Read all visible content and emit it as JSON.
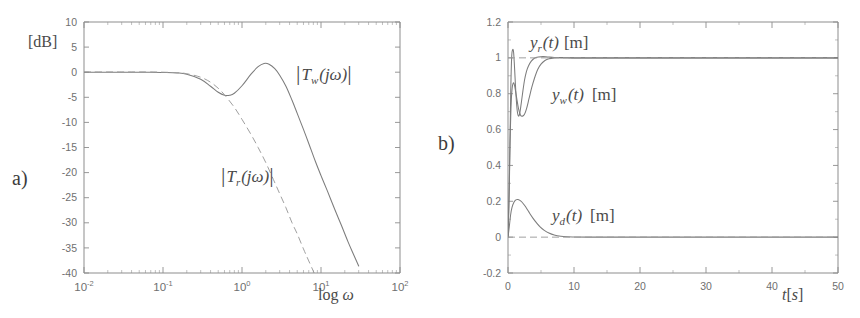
{
  "figure": {
    "background": "#ffffff",
    "line_color": "#7c7c7c",
    "axis_color": "#8d8d8d",
    "text_color": "#4a4a4a"
  },
  "panels": [
    {
      "letter": "a)",
      "name": "bode-magnitude-plot"
    },
    {
      "letter": "b)",
      "name": "time-response-plot"
    }
  ],
  "chart_data": [
    {
      "type": "line",
      "panel": "a",
      "title": "",
      "xlabel": "log ω",
      "ylabel": "[dB]",
      "xscale": "log",
      "xlim": [
        0.01,
        100
      ],
      "ylim": [
        -40,
        10
      ],
      "grid": false,
      "xticks": [
        0.01,
        0.1,
        1,
        10,
        100
      ],
      "xticklabels": [
        "10⁻²",
        "10⁻¹",
        "10⁰",
        "10¹",
        "10²"
      ],
      "xtick_mantissa": [
        "10",
        "10",
        "10",
        "10",
        "10"
      ],
      "xtick_exponent": [
        "-2",
        "-1",
        "0",
        "1",
        "2"
      ],
      "yticks": [
        10,
        5,
        0,
        -5,
        -10,
        -15,
        -20,
        -25,
        -30,
        -35,
        -40
      ],
      "yticklabels": [
        "10",
        "5",
        "0",
        "-5",
        "-10",
        "-15",
        "-20",
        "-25",
        "-30",
        "-35",
        "-40"
      ],
      "legend_position": "inline-annotations",
      "series": [
        {
          "name": "|T_w(jω)|",
          "label_text": "|T_w(jω)|",
          "label_main": "T",
          "label_sub": "w",
          "label_tail": "(jω)",
          "style": "solid",
          "x": [
            0.01,
            0.02,
            0.04,
            0.07,
            0.1,
            0.15,
            0.2,
            0.3,
            0.4,
            0.5,
            0.6,
            0.7,
            0.8,
            1.0,
            1.3,
            1.6,
            1.9,
            2.2,
            2.6,
            3.0,
            3.6,
            4.3,
            5.0,
            6.0,
            7.0,
            8.5,
            10.0,
            12.0,
            15.0,
            18.0,
            22.0,
            26.0,
            30.0
          ],
          "y": [
            0.0,
            0.0,
            0.0,
            0.0,
            -0.05,
            -0.15,
            -0.4,
            -1.4,
            -2.8,
            -4.0,
            -4.6,
            -4.6,
            -4.2,
            -2.7,
            -0.4,
            1.1,
            1.75,
            1.6,
            0.7,
            -0.6,
            -2.8,
            -5.6,
            -8.2,
            -11.4,
            -14.2,
            -17.8,
            -20.6,
            -23.6,
            -27.4,
            -30.4,
            -33.8,
            -36.4,
            -38.6
          ]
        },
        {
          "name": "|T_r(jω)|",
          "label_text": "|T_r(jω)|",
          "label_main": "T",
          "label_sub": "r",
          "label_tail": "(jω)",
          "style": "dashed",
          "x": [
            0.01,
            0.03,
            0.06,
            0.1,
            0.15,
            0.2,
            0.3,
            0.4,
            0.5,
            0.6,
            0.8,
            1.0,
            1.3,
            1.6,
            2.0,
            2.5,
            3.0,
            3.6,
            4.3,
            5.0,
            6.0,
            7.0,
            8.5,
            10.0,
            12.0
          ],
          "y": [
            0.05,
            0.05,
            0.05,
            0.0,
            -0.1,
            -0.3,
            -1.0,
            -2.0,
            -3.2,
            -4.5,
            -7.0,
            -9.4,
            -12.4,
            -15.0,
            -18.0,
            -21.4,
            -24.2,
            -27.0,
            -30.0,
            -32.2,
            -35.2,
            -37.6,
            -40.5,
            -42.5,
            -45.0
          ]
        }
      ]
    },
    {
      "type": "line",
      "panel": "b",
      "title": "",
      "xlabel": "t[s]",
      "ylabel": "",
      "xscale": "linear",
      "xlim": [
        0,
        50
      ],
      "ylim": [
        -0.2,
        1.2
      ],
      "grid": false,
      "xticks": [
        0,
        10,
        20,
        30,
        40,
        50
      ],
      "xticklabels": [
        "0",
        "10",
        "20",
        "30",
        "40",
        "50"
      ],
      "yticks": [
        1.2,
        1,
        0.8,
        0.6,
        0.4,
        0.2,
        0,
        -0.2
      ],
      "yticklabels": [
        "1.2",
        "1",
        "0.8",
        "0.6",
        "0.4",
        "0.2",
        "0",
        "-0.2"
      ],
      "legend_position": "inline-annotations",
      "unit": "[m]",
      "series": [
        {
          "name": "y_r(t)",
          "label_main": "y",
          "label_sub": "r",
          "label_tail": "(t)",
          "label_unit": "[m]",
          "style": "solid",
          "x": [
            0,
            0.2,
            0.4,
            0.55,
            0.7,
            0.85,
            1.0,
            1.2,
            1.4,
            1.6,
            1.8,
            2.0,
            2.2,
            2.5,
            2.8,
            3.1,
            3.5,
            4.0,
            4.6,
            5.3,
            6.0,
            7.0,
            8.0,
            9.0,
            10.0,
            12.0,
            15.0,
            20.0,
            30.0,
            40.0,
            50.0
          ],
          "y": [
            0.0,
            0.28,
            0.78,
            1.0,
            1.045,
            1.03,
            0.94,
            0.8,
            0.705,
            0.675,
            0.695,
            0.745,
            0.8,
            0.875,
            0.925,
            0.955,
            0.98,
            0.998,
            1.005,
            1.007,
            1.005,
            1.002,
            1.0,
            1.0,
            1.0,
            1.0,
            1.0,
            1.0,
            1.0,
            1.0,
            1.0
          ]
        },
        {
          "name": "y_w(t)",
          "label_main": "y",
          "label_sub": "w",
          "label_tail": "(t)",
          "label_unit": "[m]",
          "style": "solid",
          "x": [
            0,
            0.15,
            0.3,
            0.45,
            0.6,
            0.8,
            1.0,
            1.3,
            1.6,
            1.9,
            2.2,
            2.5,
            2.8,
            3.2,
            3.6,
            4.0,
            4.5,
            5.0,
            5.6,
            6.2,
            7.0,
            8.0,
            9.0,
            10.0,
            12.0,
            15.0,
            20.0,
            30.0,
            40.0,
            50.0
          ],
          "y": [
            0.0,
            0.22,
            0.52,
            0.72,
            0.82,
            0.86,
            0.845,
            0.78,
            0.715,
            0.68,
            0.675,
            0.685,
            0.715,
            0.775,
            0.835,
            0.885,
            0.935,
            0.965,
            0.985,
            0.995,
            1.0,
            1.002,
            1.002,
            1.0,
            1.0,
            1.0,
            1.0,
            1.0,
            1.0,
            1.0
          ]
        },
        {
          "name": "y_d(t)",
          "label_main": "y",
          "label_sub": "d",
          "label_tail": "(t)",
          "label_unit": "[m]",
          "style": "solid",
          "x": [
            0,
            0.2,
            0.4,
            0.6,
            0.9,
            1.2,
            1.5,
            1.8,
            2.1,
            2.5,
            2.9,
            3.3,
            3.8,
            4.3,
            4.9,
            5.5,
            6.2,
            7.0,
            8.0,
            9.0,
            10.0,
            12.0,
            15.0,
            20.0,
            30.0,
            40.0,
            50.0
          ],
          "y": [
            0.0,
            0.06,
            0.125,
            0.165,
            0.195,
            0.208,
            0.21,
            0.205,
            0.196,
            0.178,
            0.156,
            0.132,
            0.105,
            0.081,
            0.056,
            0.038,
            0.023,
            0.012,
            0.005,
            0.002,
            0.001,
            0.0,
            0.0,
            0.0,
            0.0,
            0.0,
            0.0
          ]
        },
        {
          "name": "reference-level-1",
          "style": "dashed-reference",
          "level": 1.0
        },
        {
          "name": "reference-level-0",
          "style": "dashed-reference",
          "level": 0.0
        }
      ]
    }
  ]
}
